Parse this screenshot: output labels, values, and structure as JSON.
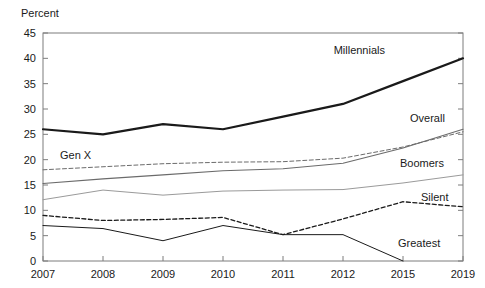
{
  "chart_data": {
    "type": "line",
    "title": "",
    "subtitle": "",
    "xlabel": "",
    "ylabel": "Percent",
    "ylim": [
      0,
      45
    ],
    "xlim": [
      2007,
      2019
    ],
    "grid": false,
    "legend_position": "inline-right-of-line-end",
    "x": [
      2007,
      2008,
      2009,
      2010,
      2011,
      2012,
      2015,
      2019
    ],
    "xtick_labels": [
      "2007",
      "2008",
      "2009",
      "2010",
      "2011",
      "2012",
      "2015",
      "2019"
    ],
    "ytick_labels": [
      "0",
      "5",
      "10",
      "15",
      "20",
      "25",
      "30",
      "35",
      "40",
      "45"
    ],
    "ytick_values": [
      0,
      5,
      10,
      15,
      20,
      25,
      30,
      35,
      40,
      45
    ],
    "series": [
      {
        "name": "Millennials",
        "label": "Millennials",
        "style": "solid",
        "width": 2.2,
        "color": "#1a1a1a",
        "values": [
          26.0,
          25.0,
          27.0,
          26.0,
          28.5,
          31.0,
          35.5,
          40.0
        ]
      },
      {
        "name": "Gen X",
        "label": "Gen X",
        "style": "dashed",
        "width": 1.0,
        "color": "#6b6b6b",
        "values": [
          18.0,
          18.6,
          19.2,
          19.5,
          19.6,
          20.3,
          22.5,
          25.5
        ]
      },
      {
        "name": "Overall",
        "label": "Overall",
        "style": "solid",
        "width": 1.1,
        "color": "#6b6b6b",
        "values": [
          15.3,
          16.2,
          17.0,
          17.8,
          18.2,
          19.3,
          22.3,
          26.0
        ]
      },
      {
        "name": "Boomers",
        "label": "Boomers",
        "style": "solid",
        "width": 1.0,
        "color": "#9a9a9a",
        "values": [
          12.1,
          14.0,
          13.0,
          13.8,
          14.0,
          14.1,
          15.4,
          17.0
        ]
      },
      {
        "name": "Silent",
        "label": "Silent",
        "style": "dashed",
        "width": 1.3,
        "color": "#1a1a1a",
        "values": [
          9.0,
          8.0,
          8.2,
          8.6,
          5.2,
          8.3,
          11.7,
          10.7
        ]
      },
      {
        "name": "Greatest",
        "label": "Greatest",
        "style": "solid",
        "width": 1.0,
        "color": "#1a1a1a",
        "values": [
          7.0,
          6.4,
          4.0,
          7.0,
          5.2,
          5.2,
          0.0,
          null
        ]
      }
    ],
    "annotations": [
      {
        "text": "Millennials",
        "anchor_series": "Millennials",
        "position": "above-right"
      },
      {
        "text": "Gen X",
        "anchor_series": "Gen X",
        "position": "above-left"
      },
      {
        "text": "Overall",
        "anchor_series": "Overall",
        "position": "above-right"
      },
      {
        "text": "Boomers",
        "anchor_series": "Boomers",
        "position": "above-right"
      },
      {
        "text": "Silent",
        "anchor_series": "Silent",
        "position": "above-right"
      },
      {
        "text": "Greatest",
        "anchor_series": "Greatest",
        "position": "right"
      }
    ]
  },
  "axis": {
    "unit_label": "Percent"
  },
  "labels": {
    "millennials": "Millennials",
    "genx": "Gen X",
    "overall": "Overall",
    "boomers": "Boomers",
    "silent": "Silent",
    "greatest": "Greatest"
  },
  "colors": {
    "frame": "#7d7d7d",
    "text": "#1a1a1a",
    "millennials": "#1a1a1a",
    "genx": "#6b6b6b",
    "overall": "#6b6b6b",
    "boomers": "#9a9a9a",
    "silent": "#1a1a1a",
    "greatest": "#1a1a1a",
    "background": "#ffffff"
  }
}
